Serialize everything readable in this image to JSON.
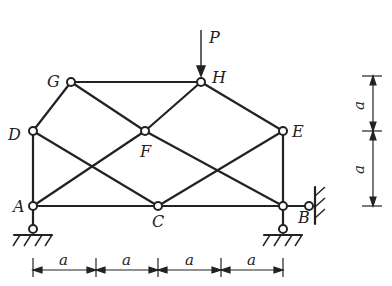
{
  "diagram": {
    "type": "truss",
    "load": {
      "label": "P",
      "node": "H",
      "direction": "down"
    },
    "nodes": {
      "A": {
        "label": "A"
      },
      "B": {
        "label": "B"
      },
      "C": {
        "label": "C"
      },
      "D": {
        "label": "D"
      },
      "E": {
        "label": "E"
      },
      "F": {
        "label": "F"
      },
      "G": {
        "label": "G"
      },
      "H": {
        "label": "H"
      }
    },
    "members": [
      [
        "A",
        "C"
      ],
      [
        "C",
        "B"
      ],
      [
        "A",
        "D"
      ],
      [
        "D",
        "G"
      ],
      [
        "G",
        "H"
      ],
      [
        "H",
        "E"
      ],
      [
        "E",
        "B"
      ],
      [
        "D",
        "C"
      ],
      [
        "G",
        "F"
      ],
      [
        "F",
        "B"
      ],
      [
        "A",
        "F"
      ],
      [
        "F",
        "H"
      ],
      [
        "C",
        "E"
      ]
    ],
    "supports": {
      "A": "pin",
      "B": "pin-and-horizontal-link"
    },
    "dimensions": {
      "horizontal": [
        "a",
        "a",
        "a",
        "a"
      ],
      "vertical": [
        "a",
        "a"
      ]
    }
  }
}
